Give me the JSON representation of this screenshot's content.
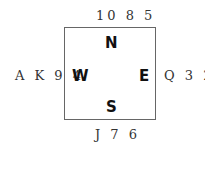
{
  "hands": {
    "north": "10 8 5",
    "west": "A K 9 4",
    "east": "Q 3 2",
    "south": "J 7 6"
  },
  "seats": {
    "north": "N",
    "west": "W",
    "east": "E",
    "south": "S"
  }
}
